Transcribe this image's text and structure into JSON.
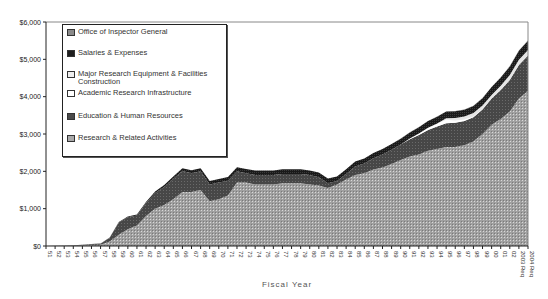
{
  "chart_data": {
    "type": "area",
    "stacked": true,
    "title": "",
    "xlabel": "Fiscal Year",
    "ylabel": "",
    "ylim": [
      0,
      6000
    ],
    "yticks": [
      "$0",
      "$1,000",
      "$2,000",
      "$3,000",
      "$4,000",
      "$5,000",
      "$6,000"
    ],
    "grid": false,
    "legend_position": "upper-left-inside",
    "categories": [
      "51",
      "52",
      "53",
      "54",
      "55",
      "56",
      "57",
      "58",
      "59",
      "60",
      "61",
      "62",
      "63",
      "64",
      "65",
      "66",
      "67",
      "68",
      "69",
      "70",
      "71",
      "72",
      "73",
      "74",
      "75",
      "76",
      "77",
      "78",
      "79",
      "80",
      "81",
      "82",
      "83",
      "84",
      "85",
      "86",
      "87",
      "88",
      "89",
      "90",
      "91",
      "92",
      "93",
      "94",
      "95",
      "96",
      "97",
      "98",
      "99",
      "00",
      "01",
      "02",
      "2003 Req",
      "2004 Req"
    ],
    "series": [
      {
        "name": "Research & Related Activities",
        "color": "#a9a9a9",
        "values": [
          2,
          4,
          6,
          8,
          15,
          25,
          35,
          120,
          300,
          450,
          550,
          800,
          1000,
          1100,
          1250,
          1450,
          1450,
          1500,
          1200,
          1250,
          1350,
          1700,
          1700,
          1650,
          1650,
          1650,
          1680,
          1680,
          1680,
          1650,
          1620,
          1550,
          1650,
          1780,
          1900,
          1950,
          2050,
          2100,
          2200,
          2300,
          2400,
          2450,
          2550,
          2600,
          2650,
          2650,
          2700,
          2800,
          3000,
          3250,
          3400,
          3600,
          3950,
          4150
        ]
      },
      {
        "name": "Education & Human Resources",
        "color": "#4a4a4a",
        "values": [
          1,
          3,
          6,
          10,
          15,
          20,
          25,
          100,
          330,
          320,
          270,
          350,
          420,
          480,
          550,
          560,
          500,
          500,
          450,
          450,
          400,
          300,
          250,
          250,
          250,
          250,
          250,
          250,
          250,
          250,
          220,
          130,
          90,
          150,
          230,
          260,
          300,
          350,
          380,
          420,
          460,
          520,
          560,
          600,
          640,
          650,
          650,
          650,
          660,
          700,
          780,
          850,
          900,
          950
        ]
      },
      {
        "name": "Academic Research Infrastructure",
        "color": "#ffffff",
        "values": [
          0,
          0,
          0,
          0,
          0,
          0,
          0,
          0,
          0,
          0,
          0,
          0,
          0,
          0,
          0,
          0,
          0,
          0,
          0,
          0,
          0,
          0,
          0,
          0,
          0,
          0,
          0,
          0,
          0,
          0,
          0,
          0,
          0,
          0,
          0,
          0,
          0,
          0,
          0,
          0,
          20,
          40,
          60,
          80,
          90,
          60,
          40,
          20,
          10,
          5,
          0,
          0,
          0,
          0
        ]
      },
      {
        "name": "Major Research Equipment & Facilities Construction",
        "color": "#e8e8e8",
        "values": [
          0,
          0,
          0,
          0,
          0,
          0,
          0,
          0,
          0,
          0,
          0,
          0,
          0,
          0,
          0,
          0,
          0,
          0,
          0,
          0,
          0,
          0,
          0,
          0,
          0,
          0,
          0,
          0,
          0,
          0,
          0,
          0,
          0,
          0,
          0,
          0,
          0,
          0,
          0,
          0,
          0,
          0,
          0,
          0,
          40,
          70,
          80,
          90,
          90,
          90,
          110,
          130,
          140,
          150
        ]
      },
      {
        "name": "Salaries & Expenses",
        "color": "#1e1e1e",
        "values": [
          0,
          1,
          2,
          3,
          5,
          5,
          5,
          10,
          15,
          20,
          25,
          30,
          40,
          50,
          60,
          70,
          80,
          80,
          90,
          95,
          100,
          110,
          115,
          120,
          120,
          120,
          125,
          125,
          125,
          125,
          125,
          125,
          125,
          125,
          130,
          135,
          140,
          145,
          150,
          155,
          160,
          170,
          175,
          180,
          180,
          180,
          180,
          190,
          200,
          210,
          220,
          230,
          240,
          250
        ]
      },
      {
        "name": "Office of Inspector General",
        "color": "#6b6b6b",
        "values": [
          0,
          0,
          0,
          0,
          0,
          0,
          0,
          0,
          0,
          0,
          0,
          0,
          0,
          0,
          0,
          0,
          0,
          0,
          0,
          0,
          0,
          0,
          0,
          0,
          0,
          0,
          0,
          0,
          0,
          0,
          0,
          0,
          0,
          0,
          0,
          0,
          0,
          0,
          0,
          5,
          5,
          5,
          5,
          5,
          5,
          5,
          5,
          5,
          5,
          5,
          5,
          10,
          10,
          10
        ]
      }
    ]
  },
  "legend": {
    "items": [
      {
        "label": "Office of Inspector General",
        "color": "#6b6b6b"
      },
      {
        "label": "Salaries & Expenses",
        "color": "#1e1e1e"
      },
      {
        "label": "Major Research Equipment & Facilities Construction",
        "color": "#e8e8e8"
      },
      {
        "label": "Academic Research Infrastructure",
        "color": "#ffffff"
      },
      {
        "label": "Education & Human Resources",
        "color": "#4a4a4a"
      },
      {
        "label": "Research & Related Activities",
        "color": "#a9a9a9"
      }
    ]
  },
  "axis": {
    "xlabel": "Fiscal Year"
  }
}
